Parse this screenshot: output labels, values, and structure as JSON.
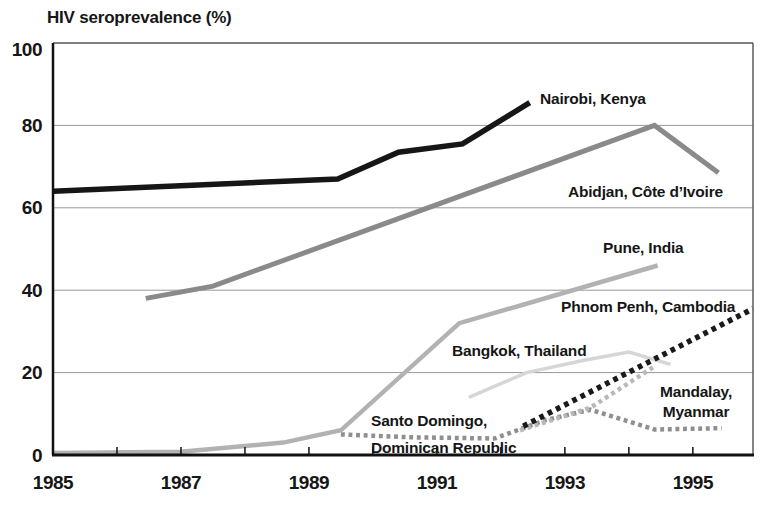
{
  "title": "HIV seroprevalence (%)",
  "chart_data": {
    "type": "line",
    "title": "HIV seroprevalence (%)",
    "xlabel": "",
    "ylabel": "HIV seroprevalence (%)",
    "xlim": [
      1985,
      1995.94
    ],
    "ylim": [
      0,
      100
    ],
    "grid": "horizontal",
    "gridline_color": "#999999",
    "yticks": [
      0,
      20,
      40,
      60,
      80,
      100
    ],
    "xticks_labeled": [
      1985,
      1987,
      1989,
      1991,
      1993,
      1995
    ],
    "xticks_minor": [
      1986,
      1987,
      1988,
      1989,
      1990,
      1991,
      1992,
      1993,
      1994,
      1995
    ],
    "legend": "inline-labels",
    "series": [
      {
        "id": "nairobi",
        "name": "Nairobi, Kenya",
        "color": "#161616",
        "line_style": "solid",
        "width": 5.5,
        "points": [
          [
            1985,
            64
          ],
          [
            1989.45,
            67
          ],
          [
            1990.4,
            73.5
          ],
          [
            1991.4,
            75.5
          ],
          [
            1992.45,
            85.5
          ]
        ],
        "label": {
          "lines": [
            "Nairobi, Kenya"
          ],
          "x": 540,
          "y": 104,
          "align": "left",
          "gap": 20
        }
      },
      {
        "id": "abidjan",
        "name": "Abidjan, Côte d’Ivoire",
        "color": "#8a8a8a",
        "line_style": "solid",
        "width": 5,
        "points": [
          [
            1986.45,
            38
          ],
          [
            1987.5,
            41
          ],
          [
            1994.4,
            80
          ],
          [
            1995.4,
            68.5
          ]
        ],
        "label": {
          "lines": [
            "Abidjan, Côte d’Ivoire"
          ],
          "x": 568,
          "y": 197,
          "align": "left",
          "gap": 20
        }
      },
      {
        "id": "pune",
        "name": "Pune, India",
        "color": "#b2b2b2",
        "line_style": "solid",
        "width": 4.5,
        "points": [
          [
            1985,
            0.5
          ],
          [
            1987,
            0.8
          ],
          [
            1988.6,
            3
          ],
          [
            1989.5,
            6
          ],
          [
            1991.35,
            32
          ],
          [
            1994.45,
            46
          ]
        ],
        "label": {
          "lines": [
            "Pune, India"
          ],
          "x": 603,
          "y": 253,
          "align": "left",
          "gap": 20
        }
      },
      {
        "id": "phnom-penh",
        "name": "Phnom Penh, Cambodia",
        "color": "#1a1a1a",
        "line_style": "dotted",
        "width": 5.5,
        "points": [
          [
            1992.35,
            7
          ],
          [
            1995.94,
            35.5
          ]
        ],
        "label": {
          "lines": [
            "Phnom Penh, Cambodia"
          ],
          "x": 561,
          "y": 312,
          "align": "left",
          "gap": 20
        }
      },
      {
        "id": "bangkok",
        "name": "Bangkok, Thailand",
        "color": "#d6d6d6",
        "line_style": "solid",
        "width": 3.5,
        "points": [
          [
            1991.5,
            14
          ],
          [
            1992.4,
            20
          ],
          [
            1993.3,
            23
          ],
          [
            1994.0,
            25
          ],
          [
            1994.65,
            22
          ]
        ],
        "label": {
          "lines": [
            "Bangkok, Thailand"
          ],
          "x": 452,
          "y": 356,
          "align": "left",
          "gap": 20
        }
      },
      {
        "id": "mandalay",
        "name": "Mandalay, Myanmar",
        "color": "#b8b8b8",
        "line_style": "dotted",
        "width": 4.5,
        "points": [
          [
            1992.3,
            6
          ],
          [
            1993.4,
            11.5
          ],
          [
            1994.4,
            21.5
          ]
        ],
        "label": {
          "lines": [
            "Mandalay,",
            "Myanmar"
          ],
          "x": 696,
          "y": 397,
          "align": "center",
          "gap": 20
        }
      },
      {
        "id": "santo-domingo",
        "name": "Santo Domingo, Dominican Republic",
        "color": "#8f8f8f",
        "line_style": "dotted",
        "width": 4.5,
        "points": [
          [
            1989.5,
            5
          ],
          [
            1990.6,
            4.3
          ],
          [
            1991.9,
            4
          ],
          [
            1992.7,
            8.5
          ],
          [
            1993.4,
            11
          ],
          [
            1994.4,
            6.2
          ],
          [
            1995.45,
            6.5
          ]
        ],
        "label": {
          "lines": [
            "Santo Domingo,",
            "Dominican Republic"
          ],
          "x": 371,
          "y": 426,
          "align": "left",
          "gap": 27
        }
      }
    ]
  }
}
